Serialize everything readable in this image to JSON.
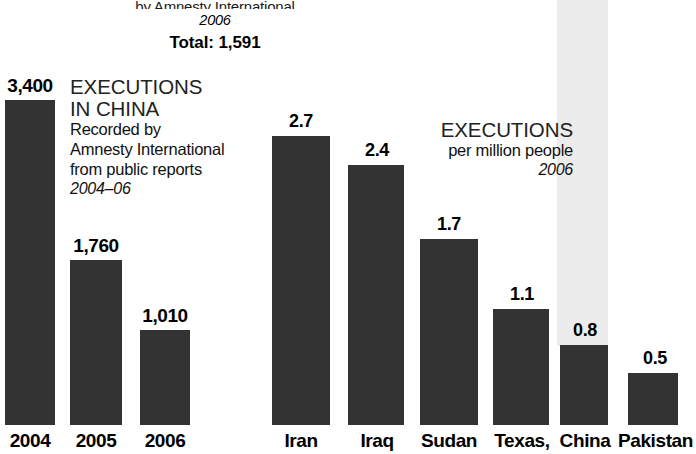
{
  "header": {
    "source_line": "by Amnesty International",
    "year": "2006",
    "total": "Total: 1,591"
  },
  "caption_left": {
    "title_line1": "EXECUTIONS",
    "title_line2": "IN CHINA",
    "body_line1": "Recorded by",
    "body_line2": "Amnesty International",
    "body_line3": "from public reports",
    "years": "2004–06"
  },
  "caption_right": {
    "title": "EXECUTIONS",
    "subtitle": "per million people",
    "year": "2006"
  },
  "colors": {
    "bar": "#333333",
    "ghost_bar": "#ececec",
    "background": "#ffffff",
    "text": "#000000"
  },
  "chart_data": [
    {
      "type": "bar",
      "title": "EXECUTIONS IN CHINA",
      "subtitle": "Recorded by Amnesty International from public reports",
      "period": "2004–06",
      "xlabel": "",
      "ylabel": "Executions",
      "categories": [
        "2004",
        "2005",
        "2006"
      ],
      "values": [
        3400,
        1760,
        1010
      ],
      "value_labels": [
        "3,400",
        "1,760",
        "1,010"
      ],
      "ylim": [
        0,
        3400
      ],
      "grid": false,
      "legend": "none"
    },
    {
      "type": "bar",
      "title": "EXECUTIONS",
      "subtitle": "per million people",
      "period": "2006",
      "xlabel": "",
      "ylabel": "Executions per million people",
      "categories": [
        "Iran",
        "Iraq",
        "Sudan",
        "Texas,",
        "China",
        "Pakistan"
      ],
      "values": [
        2.7,
        2.4,
        1.7,
        1.1,
        0.8,
        0.5
      ],
      "value_labels": [
        "2.7",
        "2.4",
        "1.7",
        "1.1",
        "0.8",
        "0.5"
      ],
      "ylim": [
        0,
        2.7
      ],
      "grid": false,
      "legend": "none",
      "annotations": [
        "China bar carries a light-gray extension band above it running to the top of the figure"
      ]
    }
  ],
  "bars_left": [
    {
      "label": "2004",
      "value_label": "3,400",
      "x": 5,
      "w": 50,
      "top": 100,
      "label_x": 0,
      "label_w": 60
    },
    {
      "label": "2005",
      "value_label": "1,760",
      "x": 70,
      "w": 52,
      "top": 260,
      "label_x": 66,
      "label_w": 60
    },
    {
      "label": "2006",
      "value_label": "1,010",
      "x": 140,
      "w": 50,
      "top": 330,
      "label_x": 135,
      "label_w": 60
    }
  ],
  "bars_right": [
    {
      "label": "Iran",
      "value_label": "2.7",
      "x": 272,
      "w": 58,
      "top": 136,
      "label_x": 268,
      "label_w": 66
    },
    {
      "label": "Iraq",
      "value_label": "2.4",
      "x": 348,
      "w": 56,
      "top": 165,
      "label_x": 344,
      "label_w": 66
    },
    {
      "label": "Sudan",
      "value_label": "1.7",
      "x": 420,
      "w": 58,
      "top": 239,
      "label_x": 412,
      "label_w": 74
    },
    {
      "label": "Texas,",
      "value_label": "1.1",
      "x": 493,
      "w": 56,
      "top": 309,
      "label_x": 486,
      "label_w": 72
    },
    {
      "label": "China",
      "value_label": "0.8",
      "x": 560,
      "w": 48,
      "top": 345,
      "label_x": 552,
      "label_w": 66
    },
    {
      "label": "Pakistan",
      "value_label": "0.5",
      "x": 628,
      "w": 50,
      "top": 373,
      "label_x": 618,
      "label_w": 74
    }
  ]
}
